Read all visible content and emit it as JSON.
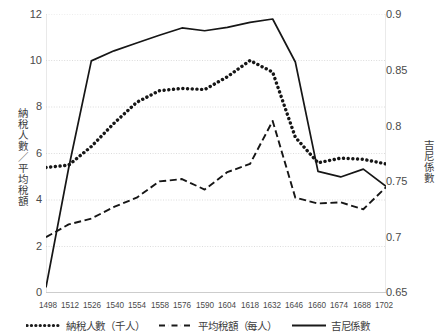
{
  "axes": {
    "y_left_title": "納稅人數／平均稅額",
    "y_right_title": "吉尼係數",
    "y_left_ticks": [
      "12",
      "10",
      "8",
      "6",
      "4",
      "2",
      "0"
    ],
    "y_right_ticks": [
      "0.9",
      "0.85",
      "0.8",
      "0.75",
      "0.7",
      "0.65"
    ],
    "x_ticks": [
      "1498",
      "1512",
      "1526",
      "1540",
      "1554",
      "1558",
      "1576",
      "1590",
      "1604",
      "1618",
      "1632",
      "1646",
      "1660",
      "1674",
      "1688",
      "1702"
    ]
  },
  "legend": {
    "items": [
      {
        "label": "納稅人數（千人）",
        "style": "dotted",
        "icon": "dotted-line-icon"
      },
      {
        "label": "平均稅額（每人）",
        "style": "dashed",
        "icon": "dashed-line-icon"
      },
      {
        "label": "吉尼係數",
        "style": "solid",
        "icon": "solid-line-icon"
      }
    ]
  },
  "chart_data": {
    "type": "line",
    "title": "",
    "xlabel": "",
    "grid": true,
    "legend_position": "bottom",
    "x": [
      1498,
      1512,
      1526,
      1540,
      1554,
      1558,
      1576,
      1590,
      1604,
      1618,
      1632,
      1646,
      1660,
      1674,
      1688,
      1702
    ],
    "axis_left": {
      "label": "納稅人數／平均稅額",
      "ylim": [
        0,
        12
      ],
      "ticks": [
        0,
        2,
        4,
        6,
        8,
        10,
        12
      ]
    },
    "axis_right": {
      "label": "吉尼係數",
      "ylim": [
        0.65,
        0.9
      ],
      "ticks": [
        0.65,
        0.7,
        0.75,
        0.8,
        0.85,
        0.9
      ]
    },
    "series": [
      {
        "name": "納稅人數（千人）",
        "axis": "left",
        "style": "dotted",
        "unit": "千人",
        "values": [
          5.4,
          5.5,
          6.3,
          7.3,
          8.2,
          8.7,
          8.8,
          8.75,
          9.3,
          10.0,
          9.5,
          6.7,
          5.6,
          5.8,
          5.75,
          5.55
        ]
      },
      {
        "name": "平均稅額（每人）",
        "axis": "left",
        "style": "dashed",
        "unit": "每人",
        "values": [
          2.4,
          2.95,
          3.2,
          3.7,
          4.1,
          4.8,
          4.9,
          4.45,
          5.2,
          5.55,
          7.4,
          4.1,
          3.85,
          3.9,
          3.6,
          4.55
        ]
      },
      {
        "name": "吉尼係數",
        "axis": "right",
        "style": "solid",
        "values": [
          0.655,
          0.762,
          0.858,
          0.867,
          0.874,
          0.881,
          0.8875,
          0.885,
          0.888,
          0.8925,
          0.8955,
          0.857,
          0.759,
          0.754,
          0.761,
          0.7455
        ]
      }
    ]
  }
}
